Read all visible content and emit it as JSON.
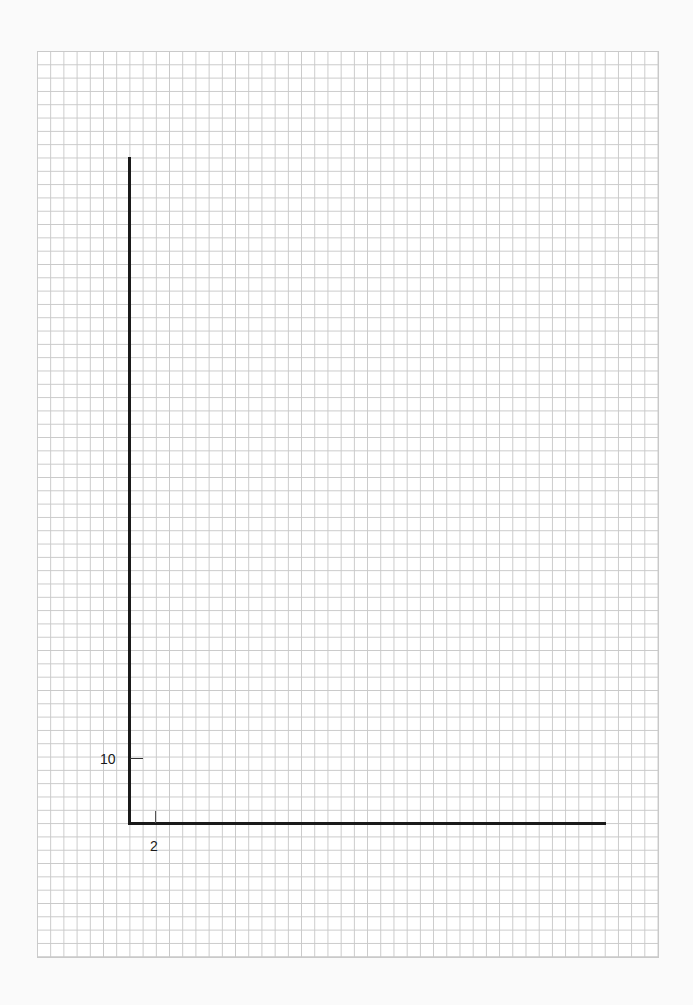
{
  "chart_data": {
    "type": "line",
    "title": "",
    "xlabel": "",
    "ylabel": "",
    "grid": true,
    "series": [],
    "x_ticks": [
      {
        "value": 2,
        "label": "2"
      }
    ],
    "y_ticks": [
      {
        "value": 10,
        "label": "10"
      }
    ],
    "xlim": [
      0,
      36.5
    ],
    "ylim": [
      0,
      50
    ],
    "legend": null
  },
  "labels": {
    "y_tick_label": "10",
    "x_tick_label": "2"
  },
  "colors": {
    "grid": "#c9c9c9",
    "axis": "#1a1a1a",
    "background": "#ffffff"
  }
}
